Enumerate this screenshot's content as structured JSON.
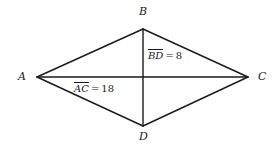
{
  "figure": {
    "kind": "rhombus-with-diagonals",
    "stroke_color": "#1a1a1a",
    "background_color": "#ffffff",
    "vertices": [
      {
        "name": "vertex-label-A",
        "label": "A",
        "x": 37,
        "y": 77
      },
      {
        "name": "vertex-label-B",
        "label": "B",
        "x": 143,
        "y": 29
      },
      {
        "name": "vertex-label-C",
        "label": "C",
        "x": 248,
        "y": 77
      },
      {
        "name": "vertex-label-D",
        "label": "D",
        "x": 143,
        "y": 126
      }
    ],
    "measures": [
      {
        "name": "diagonal-bd-measure",
        "segment": "BD",
        "equals": "=",
        "value": "8",
        "orientation": "vertical"
      },
      {
        "name": "diagonal-ac-measure",
        "segment": "AC",
        "equals": "=",
        "value": "18",
        "orientation": "horizontal"
      }
    ]
  }
}
